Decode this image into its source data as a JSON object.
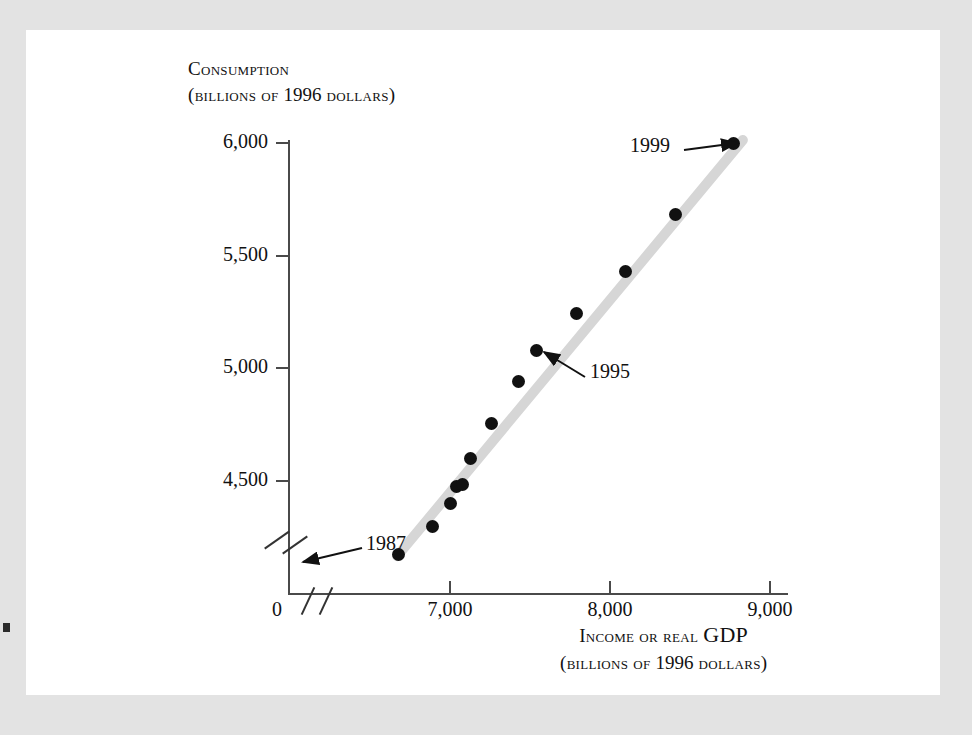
{
  "figure": {
    "background_color": "#ffffff",
    "frame_color": "#e3e3e3",
    "trendline_color": "#d6d6d6",
    "point_color": "#111111",
    "axis_color": "#4a4a4a"
  },
  "y_axis": {
    "title_line1": "Consumption",
    "title_line2_prefix": "(billions of ",
    "title_line2_year": "1996",
    "title_line2_suffix": " dollars)",
    "ticks": [
      "6,000",
      "5,500",
      "5,000",
      "4,500"
    ]
  },
  "x_axis": {
    "title_line1_prefix": "Income or real ",
    "title_line1_suffix": "GDP",
    "title_line2_prefix": "(billions of ",
    "title_line2_year": "1996",
    "title_line2_suffix": " dollars)",
    "origin_label": "0",
    "ticks": [
      "7,000",
      "8,000",
      "9,000"
    ]
  },
  "annotations": [
    {
      "label": "1987"
    },
    {
      "label": "1995"
    },
    {
      "label": "1999"
    }
  ],
  "chart_data": {
    "type": "scatter",
    "title": "",
    "xlabel": "Income or real GDP (billions of 1996 dollars)",
    "ylabel": "Consumption (billions of 1996 dollars)",
    "xlim": [
      6625,
      9000
    ],
    "ylim": [
      4150,
      6000
    ],
    "axis_break": {
      "x": true,
      "y": true,
      "x_origin_label": "0"
    },
    "grid": false,
    "legend": null,
    "xtick_labels": [
      "0",
      "7,000",
      "8,000",
      "9,000"
    ],
    "ytick_labels": [
      "4,500",
      "5,000",
      "5,500",
      "6,000"
    ],
    "series": [
      {
        "name": "Consumption vs. income, 1987-1999",
        "points": [
          {
            "year": 1987,
            "x": 6680,
            "y": 4175
          },
          {
            "year": 1988,
            "x": 6890,
            "y": 4300
          },
          {
            "year": 1989,
            "x": 7000,
            "y": 4400
          },
          {
            "year": 1990,
            "x": 7040,
            "y": 4475
          },
          {
            "year": 1991,
            "x": 7075,
            "y": 4485
          },
          {
            "year": 1992,
            "x": 7130,
            "y": 4600
          },
          {
            "year": 1993,
            "x": 7260,
            "y": 4755
          },
          {
            "year": 1994,
            "x": 7425,
            "y": 4940
          },
          {
            "year": 1995,
            "x": 7540,
            "y": 5080
          },
          {
            "year": 1996,
            "x": 7790,
            "y": 5245
          },
          {
            "year": 1997,
            "x": 8095,
            "y": 5430
          },
          {
            "year": 1998,
            "x": 8410,
            "y": 5685
          },
          {
            "year": 1999,
            "x": 8770,
            "y": 6000
          }
        ]
      }
    ],
    "trendline": {
      "x0": 6650,
      "y0": 4150,
      "x1": 8850,
      "y1": 6030
    }
  }
}
